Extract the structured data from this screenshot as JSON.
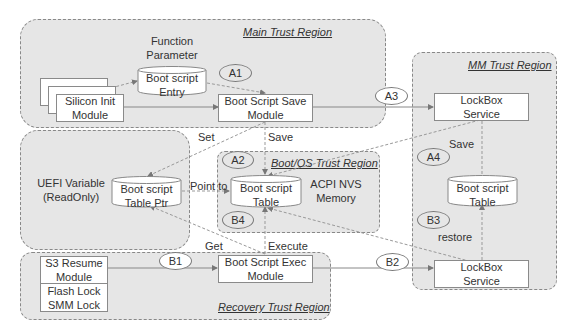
{
  "regions": {
    "main": "Main Trust Region",
    "mm": "MM Trust Region",
    "boot_os": "Boot/OS Trust Region",
    "recovery": "Recovery Trust Region"
  },
  "nodes": {
    "function_parameter": [
      "Function",
      "Parameter"
    ],
    "boot_script_entry": [
      "Boot script",
      "Entry"
    ],
    "silicon_init_module": [
      "Silicon Init",
      "Module"
    ],
    "boot_script_save_module": [
      "Boot Script Save",
      "Module"
    ],
    "lockbox_service_top": [
      "LockBox",
      "Service"
    ],
    "uefi_variable": [
      "UEFI Variable",
      "(ReadOnly)"
    ],
    "boot_script_table_ptr": [
      "Boot script",
      "Table Ptr"
    ],
    "boot_script_table_acpi": [
      "Boot script",
      "Table"
    ],
    "acpi_nvs_memory": [
      "ACPI NVS",
      "Memory"
    ],
    "boot_script_table_mm": [
      "Boot script",
      "Table"
    ],
    "s3_resume_module": [
      "S3 Resume",
      "Module"
    ],
    "flash_smm_lock": [
      "Flash Lock",
      "SMM Lock"
    ],
    "boot_script_exec_module": [
      "Boot Script Exec",
      "Module"
    ],
    "lockbox_service_bottom": [
      "LockBox",
      "Service"
    ]
  },
  "edge_labels": {
    "set": "Set",
    "save_main": "Save",
    "point_to": "Point to",
    "get": "Get",
    "execute": "Execute",
    "save_mm": "Save",
    "restore": "restore"
  },
  "step_markers": {
    "a1": "A1",
    "a2": "A2",
    "a3": "A3",
    "a4": "A4",
    "b1": "B1",
    "b2": "B2",
    "b3": "B3",
    "b4": "B4"
  }
}
